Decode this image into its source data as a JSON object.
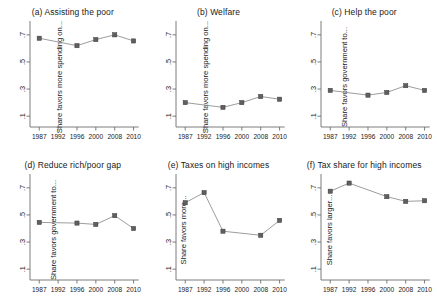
{
  "figure": {
    "panel_count": 6,
    "marker_color": "#5f5f5f",
    "line_color": "#8a8a8a",
    "axis_color": "#6e6e6e"
  },
  "chart_data": [
    {
      "type": "line",
      "panel_id": "a",
      "title": "(a) Assisting the poor",
      "ylabel": "Share favors more spending on...",
      "xlabel": "",
      "x": [
        1987,
        1992,
        1996,
        2000,
        2008,
        2010
      ],
      "categories": [
        "1987",
        "1992",
        "1996",
        "2000",
        "2008",
        "2010"
      ],
      "values": [
        0.675,
        null,
        0.62,
        0.665,
        0.7,
        0.655
      ],
      "ylim": [
        0.02,
        0.78
      ],
      "yticks": [
        0.1,
        0.3,
        0.5,
        0.7
      ],
      "ytick_labels": [
        ".1",
        ".3",
        ".5",
        ".7"
      ],
      "xticks": [
        1987,
        1992,
        1996,
        2000,
        2008,
        2010
      ],
      "grid": false,
      "legend": false
    },
    {
      "type": "line",
      "panel_id": "b",
      "title": "(b) Welfare",
      "ylabel": "Share favors more spending on...",
      "xlabel": "",
      "x": [
        1987,
        1992,
        1996,
        2000,
        2008,
        2010
      ],
      "categories": [
        "1987",
        "1992",
        "1996",
        "2000",
        "2008",
        "2010"
      ],
      "values": [
        0.2,
        null,
        0.165,
        0.2,
        0.245,
        0.225
      ],
      "ylim": [
        0.02,
        0.78
      ],
      "yticks": [
        0.1,
        0.3,
        0.5,
        0.7
      ],
      "ytick_labels": [
        ".1",
        ".3",
        ".5",
        ".7"
      ],
      "xticks": [
        1987,
        1992,
        1996,
        2000,
        2008,
        2010
      ],
      "grid": false,
      "legend": false
    },
    {
      "type": "line",
      "panel_id": "c",
      "title": "(c) Help the poor",
      "ylabel": "Share favors government to...",
      "xlabel": "",
      "x": [
        1987,
        1992,
        1996,
        2000,
        2008,
        2010
      ],
      "categories": [
        "1987",
        "1992",
        "1996",
        "2000",
        "2008",
        "2010"
      ],
      "values": [
        0.29,
        null,
        0.255,
        0.275,
        0.325,
        0.29
      ],
      "ylim": [
        0.02,
        0.78
      ],
      "yticks": [
        0.1,
        0.3,
        0.5,
        0.7
      ],
      "ytick_labels": [
        ".1",
        ".3",
        ".5",
        ".7"
      ],
      "xticks": [
        1987,
        1992,
        1996,
        2000,
        2008,
        2010
      ],
      "grid": false,
      "legend": false
    },
    {
      "type": "line",
      "panel_id": "d",
      "title": "(d) Reduce rich/poor gap",
      "ylabel": "Share favors government to...",
      "xlabel": "",
      "x": [
        1987,
        1992,
        1996,
        2000,
        2008,
        2010
      ],
      "categories": [
        "1987",
        "1992",
        "1996",
        "2000",
        "2008",
        "2010"
      ],
      "values": [
        0.445,
        null,
        0.44,
        0.43,
        0.495,
        0.4
      ],
      "ylim": [
        0.02,
        0.78
      ],
      "yticks": [
        0.1,
        0.3,
        0.5,
        0.7
      ],
      "ytick_labels": [
        ".1",
        ".3",
        ".5",
        ".7"
      ],
      "xticks": [
        1987,
        1992,
        1996,
        2000,
        2008,
        2010
      ],
      "grid": false,
      "legend": false
    },
    {
      "type": "line",
      "panel_id": "e",
      "title": "(e) Taxes on high incomes",
      "ylabel": "Share favors more...",
      "xlabel": "",
      "x": [
        1987,
        1992,
        1996,
        2000,
        2008,
        2010
      ],
      "categories": [
        "1987",
        "1992",
        "1996",
        "2000",
        "2008",
        "2010"
      ],
      "values": [
        0.59,
        0.665,
        0.38,
        null,
        0.35,
        0.46
      ],
      "ylim": [
        0.02,
        0.78
      ],
      "yticks": [
        0.1,
        0.3,
        0.5,
        0.7
      ],
      "ytick_labels": [
        ".1",
        ".3",
        ".5",
        ".7"
      ],
      "xticks": [
        1987,
        1992,
        1996,
        2000,
        2008,
        2010
      ],
      "grid": false,
      "legend": false
    },
    {
      "type": "line",
      "panel_id": "f",
      "title": "(f) Tax share for high incomes",
      "ylabel": "Share favors larger...",
      "xlabel": "",
      "x": [
        1987,
        1992,
        1996,
        2000,
        2008,
        2010
      ],
      "categories": [
        "1987",
        "1992",
        "1996",
        "2000",
        "2008",
        "2010"
      ],
      "values": [
        0.675,
        0.735,
        null,
        0.635,
        0.6,
        0.605
      ],
      "ylim": [
        0.02,
        0.78
      ],
      "yticks": [
        0.1,
        0.3,
        0.5,
        0.7
      ],
      "ytick_labels": [
        ".1",
        ".3",
        ".5",
        ".7"
      ],
      "xticks": [
        1987,
        1992,
        1996,
        2000,
        2008,
        2010
      ],
      "grid": false,
      "legend": false
    }
  ]
}
